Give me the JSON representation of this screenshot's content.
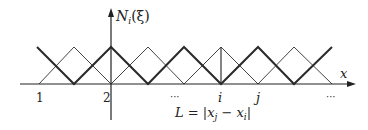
{
  "y_axis_label": "N_i(ξ)",
  "y_axis_parts": {
    "N": "N",
    "sub": "i",
    "arg": "(ξ)"
  },
  "x_axis_label": "x",
  "node_labels": [
    "1",
    "2",
    "···",
    "i",
    "j",
    "···"
  ],
  "length_label": "L = |x_j − x_i|",
  "length_parts": {
    "L": "L",
    "eq": " = |",
    "xj": "x",
    "j": "j",
    "minus": " − ",
    "xi": "x",
    "i": "i",
    "close": "|"
  },
  "colors": {
    "line": "#333333",
    "thick": "#2a2a2a",
    "axis": "#222222"
  }
}
